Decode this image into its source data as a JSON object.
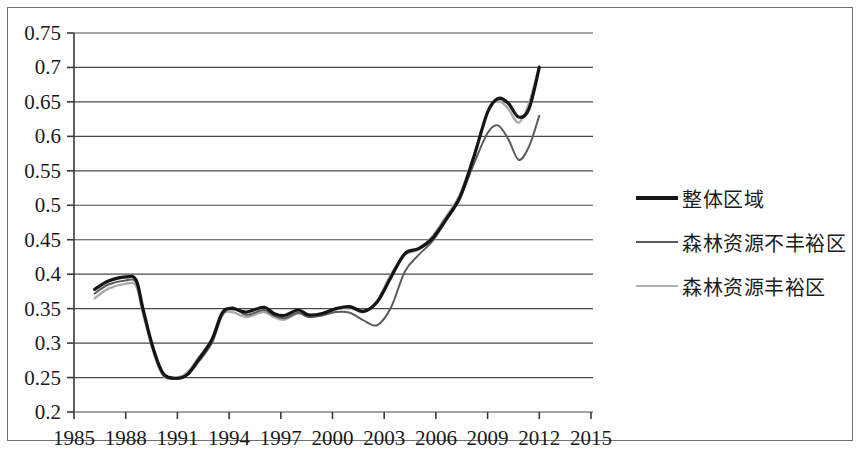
{
  "chart_data": {
    "type": "line",
    "title": "",
    "xlabel": "",
    "ylabel": "",
    "xlim": [
      1985,
      2015
    ],
    "ylim": [
      0.2,
      0.75
    ],
    "grid": true,
    "legend_position": "right",
    "x_ticks": [
      "1985",
      "1988",
      "1991",
      "1994",
      "1997",
      "2000",
      "2003",
      "2006",
      "2009",
      "2012",
      "2015"
    ],
    "y_ticks": [
      "0.2",
      "0.25",
      "0.3",
      "0.35",
      "0.4",
      "0.45",
      "0.5",
      "0.55",
      "0.6",
      "0.65",
      "0.7",
      "0.75"
    ],
    "x": [
      1986.2,
      1987,
      1988,
      1988.6,
      1989,
      1989.6,
      1990.2,
      1991,
      1991.6,
      1992.2,
      1993,
      1993.6,
      1994.2,
      1995,
      1996,
      1996.6,
      1997.2,
      1998,
      1998.6,
      1999.4,
      2000.2,
      2001,
      2001.8,
      2002.6,
      2003.4,
      2004.2,
      2005,
      2005.8,
      2006.6,
      2007.4,
      2008.2,
      2009,
      2009.6,
      2010.2,
      2010.8,
      2011.4,
      2012
    ],
    "series": [
      {
        "name": "整体区域",
        "color": "#151515",
        "width": 3.2,
        "values": [
          0.378,
          0.39,
          0.396,
          0.392,
          0.35,
          0.292,
          0.255,
          0.249,
          0.255,
          0.275,
          0.305,
          0.344,
          0.35,
          0.345,
          0.352,
          0.343,
          0.34,
          0.348,
          0.341,
          0.343,
          0.35,
          0.353,
          0.346,
          0.36,
          0.396,
          0.43,
          0.437,
          0.452,
          0.48,
          0.512,
          0.57,
          0.635,
          0.655,
          0.648,
          0.628,
          0.64,
          0.7
        ]
      },
      {
        "name": "森林资源不丰裕区",
        "color": "#5b5b5b",
        "width": 2.0,
        "values": [
          0.372,
          0.385,
          0.391,
          0.388,
          0.347,
          0.29,
          0.253,
          0.248,
          0.254,
          0.272,
          0.3,
          0.34,
          0.352,
          0.341,
          0.348,
          0.34,
          0.336,
          0.344,
          0.338,
          0.34,
          0.345,
          0.344,
          0.333,
          0.326,
          0.352,
          0.404,
          0.428,
          0.448,
          0.478,
          0.51,
          0.56,
          0.605,
          0.616,
          0.596,
          0.566,
          0.585,
          0.63
        ]
      },
      {
        "name": "森林资源丰裕区",
        "color": "#a9a9a9",
        "width": 2.4,
        "values": [
          0.365,
          0.379,
          0.386,
          0.383,
          0.343,
          0.288,
          0.252,
          0.25,
          0.258,
          0.278,
          0.306,
          0.341,
          0.345,
          0.338,
          0.345,
          0.338,
          0.334,
          0.343,
          0.339,
          0.342,
          0.349,
          0.352,
          0.345,
          0.362,
          0.4,
          0.428,
          0.436,
          0.455,
          0.484,
          0.516,
          0.572,
          0.636,
          0.652,
          0.64,
          0.62,
          0.648,
          0.702
        ]
      }
    ]
  },
  "legend": {
    "items": [
      {
        "label": "整体区域",
        "color": "#151515",
        "thickness": "4px"
      },
      {
        "label": "森林资源不丰裕区",
        "color": "#5b5b5b",
        "thickness": "2px"
      },
      {
        "label": "森林资源丰裕区",
        "color": "#b0b0b0",
        "thickness": "2px"
      }
    ]
  },
  "axes": {
    "axis_color": "#3a3a3a",
    "grid_color": "#4a4a4a",
    "frame_color": "#6f6f6f"
  }
}
